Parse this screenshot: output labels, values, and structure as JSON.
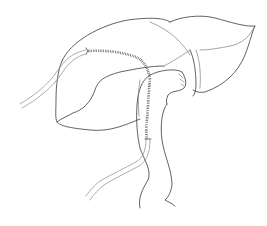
{
  "figure": {
    "kind": "medical line illustration",
    "line_color": "#3a3a3a",
    "background": "#ffffff",
    "parts": [
      {
        "id": "main-organ",
        "label": "organ body"
      },
      {
        "id": "right-lobe",
        "label": "distal segment"
      },
      {
        "id": "pouch",
        "label": "pouch with sutures"
      },
      {
        "id": "suture-line",
        "label": "running suture line"
      },
      {
        "id": "upper-tube",
        "label": "upper drainage tube"
      },
      {
        "id": "lower-tube",
        "label": "lower drainage tube"
      },
      {
        "id": "descending-limb",
        "label": "descending limb"
      }
    ]
  }
}
